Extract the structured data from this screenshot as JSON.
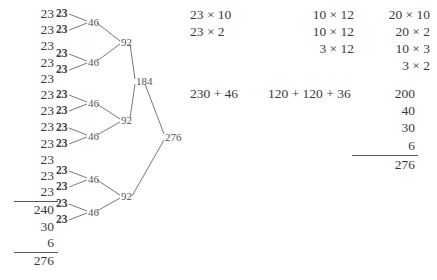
{
  "repeated_addition_column": {
    "addends": [
      "23",
      "23",
      "23",
      "23",
      "23",
      "23",
      "23",
      "23",
      "23",
      "23",
      "23",
      "23"
    ],
    "partials": [
      "240",
      "30",
      "6"
    ],
    "total": "276"
  },
  "doubling_tree": {
    "leaves": [
      "23",
      "23",
      "23",
      "23",
      "23",
      "23",
      "23",
      "23",
      "23",
      "23",
      "23",
      "23"
    ],
    "level_46": [
      "46",
      "46",
      "46",
      "46",
      "46",
      "46"
    ],
    "level_92": [
      "92",
      "92",
      "92"
    ],
    "level_184": "184",
    "root": "276"
  },
  "column_a": {
    "terms": [
      "23 × 10",
      "23 × 2"
    ],
    "sum": "230 + 46"
  },
  "column_b": {
    "terms": [
      "10 × 12",
      "10 × 12",
      "3 × 12"
    ],
    "sum": "120 + 120 + 36"
  },
  "column_c": {
    "terms": [
      "20 × 10",
      "20 × 2",
      "10 × 3",
      "3 × 2"
    ],
    "partials": [
      "200",
      "40",
      "30",
      "6"
    ],
    "total": "276"
  },
  "colors": {
    "ink": "#3a3a3a",
    "tree_ink": "#555555",
    "rule": "#555555",
    "background": "#ffffff"
  }
}
